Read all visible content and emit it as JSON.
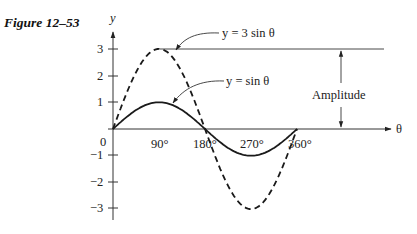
{
  "figure": {
    "caption": "Figure 12–53"
  },
  "chart_data": {
    "type": "line",
    "title": "Figure 12–53",
    "xlabel": "θ",
    "ylabel": "y",
    "x_ticks": [
      "90°",
      "180°",
      "270°",
      "360°"
    ],
    "x_tick_values": [
      90,
      180,
      270,
      360
    ],
    "y_ticks": [
      3,
      2,
      1,
      -1,
      -2,
      -3
    ],
    "y_tick_labels": [
      "3",
      "2",
      "1",
      "−1",
      "−2",
      "−3"
    ],
    "origin_label": "0",
    "xlim": [
      0,
      360
    ],
    "ylim": [
      -3.5,
      3.5
    ],
    "grid": false,
    "series": [
      {
        "name": "y = sin θ",
        "style": "solid",
        "amplitude": 1,
        "x": [
          0,
          45,
          90,
          135,
          180,
          225,
          270,
          315,
          360
        ],
        "values": [
          0,
          0.707,
          1,
          0.707,
          0,
          -0.707,
          -1,
          -0.707,
          0
        ]
      },
      {
        "name": "y = 3 sin θ",
        "style": "dashed",
        "amplitude": 3,
        "x": [
          0,
          45,
          90,
          135,
          180,
          225,
          270,
          315,
          360
        ],
        "values": [
          0,
          2.121,
          3,
          2.121,
          0,
          -2.121,
          -3,
          -2.121,
          0
        ]
      }
    ],
    "annotations": [
      {
        "text": "y = 3 sin θ",
        "points_to": "y = 3 sin θ curve near θ = 90°"
      },
      {
        "text": "y = sin θ",
        "points_to": "y = sin θ curve near θ = 90°"
      },
      {
        "text": "Amplitude",
        "description": "double arrow from θ-axis to horizontal line at y = 3"
      }
    ]
  },
  "labels": {
    "y_axis": "y",
    "theta_axis": "θ",
    "origin": "0",
    "tick_90": "90°",
    "tick_180": "180°",
    "tick_270": "270°",
    "tick_360": "360°",
    "y_3": "3",
    "y_2": "2",
    "y_1": "1",
    "y_m1": "−1",
    "y_m2": "−2",
    "y_m3": "−3",
    "sin3_label": "y = 3 sin θ",
    "sin1_label": "y = sin θ",
    "amplitude": "Amplitude"
  }
}
